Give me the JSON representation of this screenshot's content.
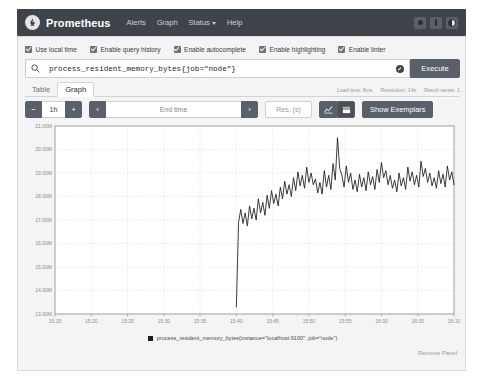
{
  "navbar": {
    "brand": "Prometheus",
    "logo_icon": "prometheus-torch-icon",
    "links": [
      {
        "label": "Alerts",
        "icon": ""
      },
      {
        "label": "Graph",
        "icon": ""
      },
      {
        "label": "Status",
        "icon": "chevron-down-icon"
      },
      {
        "label": "Help",
        "icon": ""
      }
    ],
    "right_icons": [
      "circle-indicator-icon",
      "bar-indicator-icon",
      "theme-toggle-icon"
    ]
  },
  "options": [
    {
      "label": "Use local time",
      "checked": true
    },
    {
      "label": "Enable query history",
      "checked": true
    },
    {
      "label": "Enable autocomplete",
      "checked": true
    },
    {
      "label": "Enable highlighting",
      "checked": true
    },
    {
      "label": "Enable linter",
      "checked": true
    }
  ],
  "query": {
    "search_icon": "search-icon",
    "value": "process_resident_memory_bytes{job=\"node\"}",
    "placeholder": "Expression (press Shift+Enter for newlines)",
    "clear_icon": "clear-circle-icon",
    "execute_label": "Execute"
  },
  "tabs": [
    {
      "label": "Table",
      "active": false
    },
    {
      "label": "Graph",
      "active": true
    }
  ],
  "stats": {
    "load_time": "Load time: 8ms",
    "resolution": "Resolution: 14s",
    "result_series": "Result series: 1"
  },
  "controls": {
    "range_minus": "−",
    "range_value": "1h",
    "range_plus": "+",
    "nav_prev": "‹",
    "end_time_placeholder": "End time",
    "nav_next": "›",
    "res_placeholder": "Res. (s)",
    "chart_type_line_icon": "line-chart-icon",
    "chart_type_stacked_icon": "stacked-chart-icon",
    "show_exemplars_label": "Show Exemplars"
  },
  "legend": {
    "swatch_color": "#1a1a1a",
    "series_label": "process_resident_memory_bytes{instance=\"localhost:9100\", job=\"node\"}"
  },
  "footer": {
    "remove_panel_label": "Remove Panel"
  },
  "chart_data": {
    "type": "line",
    "title": "",
    "xlabel": "",
    "ylabel": "",
    "grid": true,
    "legend_position": "bottom",
    "line_color": "#1a1a1a",
    "ylim": [
      13000000,
      21000000
    ],
    "ytick_labels": [
      "21.00M",
      "20.00M",
      "19.00M",
      "18.00M",
      "17.00M",
      "16.00M",
      "15.00M",
      "14.00M",
      "13.00M"
    ],
    "ytick_values": [
      21000000,
      20000000,
      19000000,
      18000000,
      17000000,
      16000000,
      15000000,
      14000000,
      13000000
    ],
    "xtick_labels": [
      "15:15",
      "15:20",
      "15:25",
      "15:30",
      "15:35",
      "15:40",
      "15:45",
      "15:50",
      "15:55",
      "16:00",
      "16:05",
      "16:10"
    ],
    "series": [
      {
        "name": "process_resident_memory_bytes{instance=\"localhost:9100\", job=\"node\"}",
        "x_start_label": "15:40",
        "x_end_label": "16:13",
        "values": [
          13300000,
          16900000,
          17450000,
          16850000,
          17300000,
          16750000,
          17600000,
          17050000,
          17500000,
          17000000,
          17900000,
          17300000,
          17750000,
          17200000,
          18050000,
          17500000,
          18250000,
          17700000,
          18100000,
          17600000,
          18400000,
          17900000,
          18650000,
          18100000,
          18500000,
          18000000,
          18800000,
          18250000,
          19050000,
          18450000,
          18900000,
          18350000,
          19250000,
          18600000,
          19000000,
          18500000,
          18750000,
          18150000,
          18600000,
          18100000,
          19100000,
          18400000,
          18900000,
          18300000,
          19400000,
          18700000,
          20500000,
          19200000,
          18900000,
          18400000,
          19300000,
          18600000,
          19000000,
          18300000,
          18700000,
          18200000,
          18950000,
          18400000,
          18800000,
          18250000,
          19050000,
          18500000,
          18850000,
          18300000,
          19150000,
          18600000,
          19450000,
          18800000,
          19100000,
          18500000,
          18900000,
          18350000,
          18700000,
          18200000,
          19000000,
          18450000,
          18800000,
          18300000,
          19250000,
          18650000,
          19050000,
          18500000,
          18900000,
          18400000,
          19500000,
          18850000,
          19200000,
          18600000,
          19000000,
          18450000,
          18800000,
          18350000,
          19100000,
          18550000,
          18950000,
          18400000,
          19300000,
          18700000,
          19050000,
          18500000
        ]
      }
    ]
  }
}
